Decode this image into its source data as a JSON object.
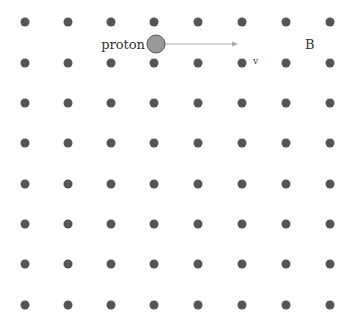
{
  "diagram": {
    "field_dots": {
      "columns_x": [
        25,
        68,
        111,
        154,
        198,
        242,
        286,
        330
      ],
      "rows_y": [
        22,
        63,
        103,
        143,
        184,
        224,
        264,
        305
      ],
      "radius": 4.5,
      "color": "#555555"
    },
    "proton": {
      "label": "proton",
      "cx": 156,
      "cy": 44,
      "r": 9,
      "fill": "#999999",
      "stroke": "#555555"
    },
    "velocity": {
      "label": "v",
      "x1": 165,
      "y1": 44,
      "x2": 238,
      "y2": 44,
      "color": "#aaaaaa"
    },
    "field_label": "B"
  }
}
